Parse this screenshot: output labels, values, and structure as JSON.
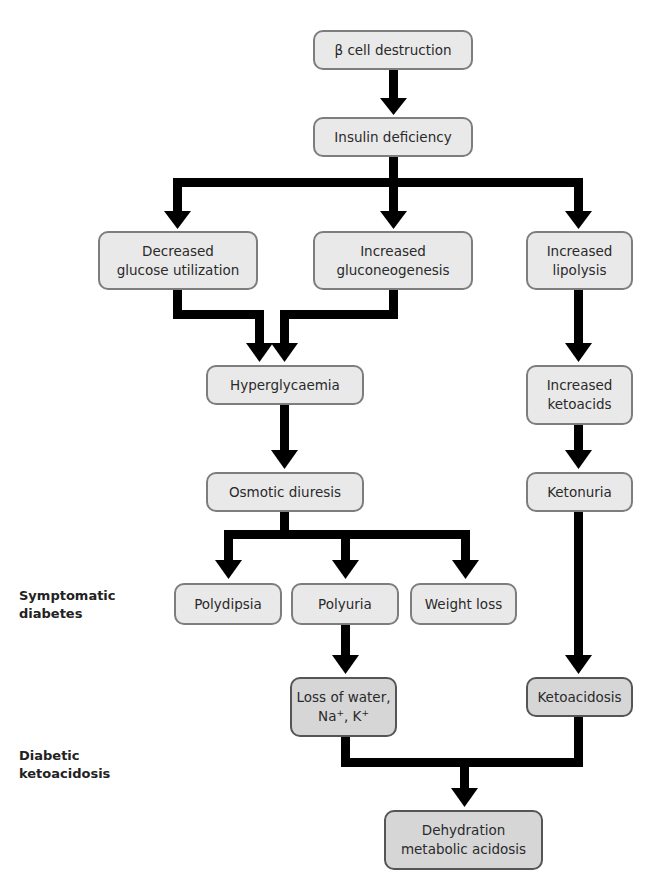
{
  "diagram": {
    "nodes": {
      "beta_cell": "β cell destruction",
      "insulin_def": "Insulin deficiency",
      "dec_glucose_1": "Decreased",
      "dec_glucose_2": "glucose utilization",
      "inc_gluco_1": "Increased",
      "inc_gluco_2": "gluconeogenesis",
      "inc_lipo_1": "Increased",
      "inc_lipo_2": "lipolysis",
      "hyperglycaemia": "Hyperglycaemia",
      "inc_keto_1": "Increased",
      "inc_keto_2": "ketoacids",
      "osmotic": "Osmotic diuresis",
      "ketonuria": "Ketonuria",
      "polydipsia": "Polydipsia",
      "polyuria": "Polyuria",
      "weight_loss": "Weight loss",
      "loss_water_1": "Loss of water,",
      "loss_water_na": "Na",
      "loss_water_sep": ", K",
      "plus": "+",
      "ketoacidosis": "Ketoacidosis",
      "dehydration_1": "Dehydration",
      "dehydration_2": "metabolic acidosis"
    },
    "side_labels": {
      "symptomatic_1": "Symptomatic",
      "symptomatic_2": "diabetes",
      "dka_1": "Diabetic",
      "dka_2": "ketoacidosis"
    },
    "colors": {
      "box_fill": "#e9e9e9",
      "box_fill_dark": "#d6d6d6",
      "arrow": "#000000"
    }
  }
}
